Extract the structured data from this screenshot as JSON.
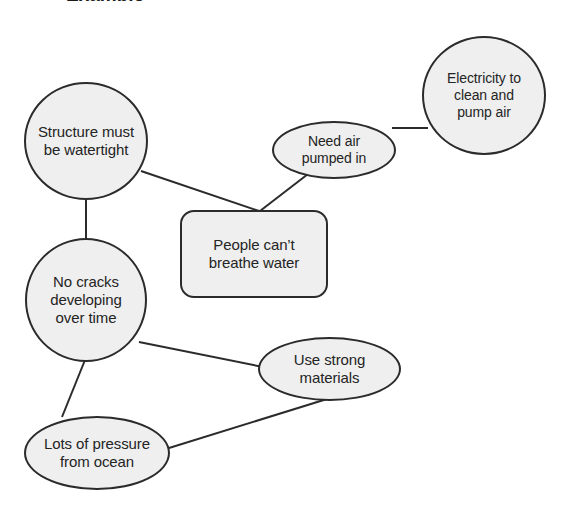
{
  "diagram": {
    "title_fragment": "Example",
    "background_color": "#ffffff",
    "node_fill_color": "#efefef",
    "node_stroke_color": "#2b2b2b",
    "text_color": "#242424",
    "edge_color": "#2b2b2b",
    "nodes": [
      {
        "id": "structure-watertight",
        "name": "node-structure-watertight",
        "shape": "circle",
        "label": "Structure must\nbe watertight",
        "x": 24,
        "y": 82,
        "w": 124,
        "h": 118,
        "font_size": 15
      },
      {
        "id": "no-cracks",
        "name": "node-no-cracks",
        "shape": "circle",
        "label": "No cracks\ndeveloping\nover time",
        "x": 25,
        "y": 238,
        "w": 122,
        "h": 124,
        "font_size": 15
      },
      {
        "id": "lots-of-pressure",
        "name": "node-lots-of-pressure",
        "shape": "ellipse",
        "label": "Lots of pressure\nfrom ocean",
        "x": 24,
        "y": 416,
        "w": 146,
        "h": 74,
        "font_size": 15
      },
      {
        "id": "people-cant-breathe",
        "name": "node-people-cant-breathe-water",
        "shape": "rounded-rect",
        "label": "People can’t\nbreathe water",
        "x": 180,
        "y": 210,
        "w": 148,
        "h": 88,
        "font_size": 15
      },
      {
        "id": "need-air-pumped",
        "name": "node-need-air-pumped-in",
        "shape": "ellipse",
        "label": "Need air\npumped in",
        "x": 272,
        "y": 121,
        "w": 124,
        "h": 58,
        "font_size": 14
      },
      {
        "id": "electricity",
        "name": "node-electricity-clean-pump-air",
        "shape": "circle",
        "label": "Electricity to\nclean and\npump air",
        "x": 422,
        "y": 36,
        "w": 124,
        "h": 119,
        "font_size": 14
      },
      {
        "id": "use-strong-materials",
        "name": "node-use-strong-materials",
        "shape": "ellipse",
        "label": "Use strong\nmaterials",
        "x": 258,
        "y": 337,
        "w": 143,
        "h": 64,
        "font_size": 15
      }
    ],
    "edges": [
      {
        "id": "edge-structure-to-nocracks",
        "name": "edge-structure-watertight-to-no-cracks",
        "from": "structure-watertight",
        "to": "no-cracks",
        "x1": 86,
        "y1": 200,
        "x2": 86,
        "y2": 239
      },
      {
        "id": "edge-structure-to-people",
        "name": "edge-structure-watertight-to-people-cant-breathe",
        "from": "structure-watertight",
        "to": "people-cant-breathe",
        "x1": 141,
        "y1": 171,
        "x2": 259,
        "y2": 211
      },
      {
        "id": "edge-needair-to-people",
        "name": "edge-need-air-pumped-in-to-people-cant-breathe",
        "from": "need-air-pumped",
        "to": "people-cant-breathe",
        "x1": 308,
        "y1": 174,
        "x2": 260,
        "y2": 211
      },
      {
        "id": "edge-needair-to-electricity",
        "name": "edge-need-air-pumped-in-to-electricity",
        "from": "need-air-pumped",
        "to": "electricity",
        "x1": 392,
        "y1": 128,
        "x2": 428,
        "y2": 128
      },
      {
        "id": "edge-nocracks-to-pressure",
        "name": "edge-no-cracks-to-lots-of-pressure",
        "from": "no-cracks",
        "to": "lots-of-pressure",
        "x1": 85,
        "y1": 360,
        "x2": 62,
        "y2": 417
      },
      {
        "id": "edge-nocracks-to-materials",
        "name": "edge-no-cracks-to-use-strong-materials",
        "from": "no-cracks",
        "to": "use-strong-materials",
        "x1": 139,
        "y1": 342,
        "x2": 263,
        "y2": 367
      },
      {
        "id": "edge-pressure-to-materials",
        "name": "edge-lots-of-pressure-to-use-strong-materials",
        "from": "lots-of-pressure",
        "to": "use-strong-materials",
        "x1": 169,
        "y1": 448,
        "x2": 327,
        "y2": 399
      }
    ]
  }
}
